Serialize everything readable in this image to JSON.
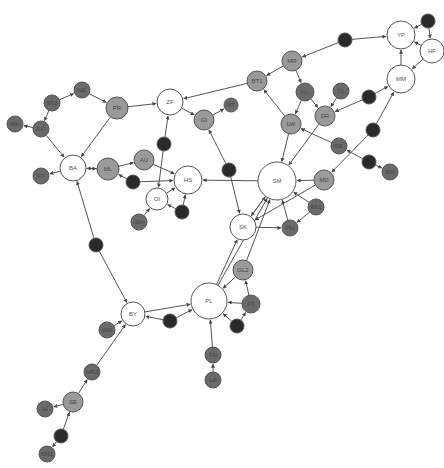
{
  "diagram": {
    "type": "directed-network",
    "colors": {
      "white": "#ffffff",
      "light": "#9a9a9a",
      "mid": "#6a6a6a",
      "dark": "#2a2a2a",
      "stroke": "#555555",
      "edge": "#555555"
    },
    "nodes": [
      {
        "id": "YP",
        "label": "YP",
        "x": 401,
        "y": 35,
        "r": 14,
        "fill": "white"
      },
      {
        "id": "HF",
        "label": "HF",
        "x": 432,
        "y": 51,
        "r": 12,
        "fill": "white"
      },
      {
        "id": "YP_top",
        "label": "",
        "x": 428,
        "y": 21,
        "r": 7,
        "fill": "dark"
      },
      {
        "id": "MM",
        "label": "MM",
        "x": 401,
        "y": 79,
        "r": 14,
        "fill": "white"
      },
      {
        "id": "MR_in",
        "label": "",
        "x": 345,
        "y": 40,
        "r": 7,
        "fill": "dark"
      },
      {
        "id": "MR",
        "label": "MR",
        "x": 292,
        "y": 61,
        "r": 10,
        "fill": "light"
      },
      {
        "id": "BT1",
        "label": "BT1",
        "x": 257,
        "y": 81,
        "r": 10,
        "fill": "light"
      },
      {
        "id": "NL",
        "label": "NL",
        "x": 305,
        "y": 92,
        "r": 9,
        "fill": "mid"
      },
      {
        "id": "CL",
        "label": "CL",
        "x": 341,
        "y": 91,
        "r": 8,
        "fill": "mid"
      },
      {
        "id": "DR_in",
        "label": "",
        "x": 369,
        "y": 97,
        "r": 7,
        "fill": "dark"
      },
      {
        "id": "DR",
        "label": "DR",
        "x": 325,
        "y": 116,
        "r": 10,
        "fill": "light"
      },
      {
        "id": "LW",
        "label": "LW",
        "x": 291,
        "y": 124,
        "r": 10,
        "fill": "light"
      },
      {
        "id": "MM_dn",
        "label": "",
        "x": 373,
        "y": 130,
        "r": 7,
        "fill": "dark"
      },
      {
        "id": "DE",
        "label": "DE",
        "x": 339,
        "y": 146,
        "r": 8,
        "fill": "mid"
      },
      {
        "id": "BE",
        "label": "",
        "x": 369,
        "y": 162,
        "r": 7,
        "fill": "dark"
      },
      {
        "id": "EM",
        "label": "EM",
        "x": 390,
        "y": 172,
        "r": 8,
        "fill": "mid"
      },
      {
        "id": "MD",
        "label": "MD",
        "x": 324,
        "y": 180,
        "r": 10,
        "fill": "light"
      },
      {
        "id": "SM",
        "label": "SM",
        "x": 277,
        "y": 181,
        "r": 19,
        "fill": "white"
      },
      {
        "id": "BT1b",
        "label": "BT1",
        "x": 316,
        "y": 207,
        "r": 8,
        "fill": "mid"
      },
      {
        "id": "PH",
        "label": "PH",
        "x": 290,
        "y": 228,
        "r": 8,
        "fill": "mid"
      },
      {
        "id": "SK",
        "label": "SK",
        "x": 243,
        "y": 227,
        "r": 13,
        "fill": "white"
      },
      {
        "id": "ZF",
        "label": "ZF",
        "x": 170,
        "y": 102,
        "r": 13,
        "fill": "white"
      },
      {
        "id": "HT",
        "label": "HT",
        "x": 231,
        "y": 105,
        "r": 7,
        "fill": "mid"
      },
      {
        "id": "GI",
        "label": "GI",
        "x": 204,
        "y": 120,
        "r": 10,
        "fill": "light"
      },
      {
        "id": "ZF_dn",
        "label": "",
        "x": 164,
        "y": 144,
        "r": 7,
        "fill": "dark"
      },
      {
        "id": "GI_dn",
        "label": "",
        "x": 229,
        "y": 170,
        "r": 7,
        "fill": "dark"
      },
      {
        "id": "PR",
        "label": "PR",
        "x": 117,
        "y": 108,
        "r": 11,
        "fill": "light"
      },
      {
        "id": "NE",
        "label": "NE",
        "x": 82,
        "y": 90,
        "r": 8,
        "fill": "mid"
      },
      {
        "id": "ST2",
        "label": "ST2",
        "x": 52,
        "y": 103,
        "r": 8,
        "fill": "mid"
      },
      {
        "id": "MH",
        "label": "MH",
        "x": 15,
        "y": 124,
        "r": 8,
        "fill": "mid"
      },
      {
        "id": "SG",
        "label": "SG",
        "x": 41,
        "y": 129,
        "r": 8,
        "fill": "mid"
      },
      {
        "id": "BA",
        "label": "BA",
        "x": 73,
        "y": 168,
        "r": 13,
        "fill": "white"
      },
      {
        "id": "FT",
        "label": "FT",
        "x": 41,
        "y": 176,
        "r": 8,
        "fill": "mid"
      },
      {
        "id": "ML",
        "label": "ML",
        "x": 108,
        "y": 169,
        "r": 11,
        "fill": "light"
      },
      {
        "id": "AU",
        "label": "AU",
        "x": 144,
        "y": 160,
        "r": 10,
        "fill": "light"
      },
      {
        "id": "ML_dn",
        "label": "",
        "x": 133,
        "y": 182,
        "r": 7,
        "fill": "dark"
      },
      {
        "id": "HS",
        "label": "HS",
        "x": 188,
        "y": 180,
        "r": 14,
        "fill": "white"
      },
      {
        "id": "OI",
        "label": "OI",
        "x": 157,
        "y": 199,
        "r": 11,
        "fill": "white"
      },
      {
        "id": "OI_r",
        "label": "",
        "x": 182,
        "y": 212,
        "r": 7,
        "fill": "dark"
      },
      {
        "id": "SH",
        "label": "SH",
        "x": 139,
        "y": 222,
        "r": 8,
        "fill": "mid"
      },
      {
        "id": "BA_dn",
        "label": "",
        "x": 96,
        "y": 245,
        "r": 7,
        "fill": "dark"
      },
      {
        "id": "BY",
        "label": "BY",
        "x": 133,
        "y": 314,
        "r": 12,
        "fill": "white"
      },
      {
        "id": "PL",
        "label": "PL",
        "x": 209,
        "y": 301,
        "r": 18,
        "fill": "white"
      },
      {
        "id": "PL_in",
        "label": "",
        "x": 170,
        "y": 321,
        "r": 7,
        "fill": "dark"
      },
      {
        "id": "GL2",
        "label": "GL2",
        "x": 243,
        "y": 270,
        "r": 10,
        "fill": "light"
      },
      {
        "id": "FS",
        "label": "FS",
        "x": 251,
        "y": 304,
        "r": 9,
        "fill": "mid"
      },
      {
        "id": "PL_dn",
        "label": "",
        "x": 237,
        "y": 326,
        "r": 7,
        "fill": "dark"
      },
      {
        "id": "FN",
        "label": "FN",
        "x": 213,
        "y": 355,
        "r": 8,
        "fill": "mid"
      },
      {
        "id": "LR",
        "label": "LR",
        "x": 213,
        "y": 380,
        "r": 8,
        "fill": "mid"
      },
      {
        "id": "WR",
        "label": "WR",
        "x": 107,
        "y": 330,
        "r": 8,
        "fill": "mid"
      },
      {
        "id": "HR2",
        "label": "HR2",
        "x": 92,
        "y": 372,
        "r": 8,
        "fill": "mid"
      },
      {
        "id": "SE",
        "label": "SE",
        "x": 73,
        "y": 402,
        "r": 10,
        "fill": "light"
      },
      {
        "id": "HI",
        "label": "HI",
        "x": 45,
        "y": 409,
        "r": 8,
        "fill": "mid"
      },
      {
        "id": "SE_dn",
        "label": "",
        "x": 61,
        "y": 436,
        "r": 7,
        "fill": "dark"
      },
      {
        "id": "NH2",
        "label": "NH2",
        "x": 47,
        "y": 454,
        "r": 8,
        "fill": "mid"
      }
    ],
    "edges": [
      [
        "MR_in",
        "YP"
      ],
      [
        "MR_in",
        "MR"
      ],
      [
        "YP_top",
        "YP"
      ],
      [
        "YP_top",
        "HF"
      ],
      [
        "HF",
        "YP"
      ],
      [
        "MM",
        "YP"
      ],
      [
        "HF",
        "MM"
      ],
      [
        "MR",
        "BT1"
      ],
      [
        "MR",
        "NL"
      ],
      [
        "NL",
        "DR"
      ],
      [
        "NL",
        "LW"
      ],
      [
        "CL",
        "DR"
      ],
      [
        "DR_in",
        "DR"
      ],
      [
        "DR_in",
        "MM"
      ],
      [
        "BT1",
        "ZF"
      ],
      [
        "LW",
        "BT1"
      ],
      [
        "LW",
        "SM"
      ],
      [
        "DR",
        "SM"
      ],
      [
        "MM_dn",
        "MM"
      ],
      [
        "MM_dn",
        "MD"
      ],
      [
        "DE",
        "LW"
      ],
      [
        "BE",
        "DE"
      ],
      [
        "BE",
        "EM"
      ],
      [
        "MD",
        "SM"
      ],
      [
        "MD",
        "SK"
      ],
      [
        "BT1b",
        "SM"
      ],
      [
        "BT1b",
        "PH"
      ],
      [
        "PH",
        "SM"
      ],
      [
        "SK",
        "PH"
      ],
      [
        "SK",
        "SM"
      ],
      [
        "SM",
        "SK"
      ],
      [
        "SM",
        "HS"
      ],
      [
        "ZF",
        "GI"
      ],
      [
        "GI",
        "HT"
      ],
      [
        "GI_dn",
        "GI"
      ],
      [
        "GI_dn",
        "SK"
      ],
      [
        "ZF_dn",
        "ZF"
      ],
      [
        "ZF_dn",
        "OI"
      ],
      [
        "PR",
        "ZF"
      ],
      [
        "PR",
        "BA"
      ],
      [
        "NE",
        "PR"
      ],
      [
        "ST2",
        "NE"
      ],
      [
        "ST2",
        "SG"
      ],
      [
        "SG",
        "MH"
      ],
      [
        "SG",
        "BA"
      ],
      [
        "BA",
        "FT"
      ],
      [
        "ML",
        "BA"
      ],
      [
        "BA",
        "ML"
      ],
      [
        "ML",
        "AU"
      ],
      [
        "ML_dn",
        "ML"
      ],
      [
        "ML_dn",
        "HS"
      ],
      [
        "AU",
        "HS"
      ],
      [
        "OI",
        "HS"
      ],
      [
        "OI_r",
        "HS"
      ],
      [
        "OI_r",
        "OI"
      ],
      [
        "SH",
        "OI"
      ],
      [
        "BA_dn",
        "BA"
      ],
      [
        "BA_dn",
        "BY"
      ],
      [
        "BY",
        "PL"
      ],
      [
        "PL_in",
        "BY"
      ],
      [
        "PL_in",
        "PL"
      ],
      [
        "PL",
        "SK"
      ],
      [
        "PL",
        "SM"
      ],
      [
        "GL2",
        "PL"
      ],
      [
        "GL2",
        "SM"
      ],
      [
        "FS",
        "GL2"
      ],
      [
        "FS",
        "PL"
      ],
      [
        "PL_dn",
        "PL"
      ],
      [
        "PL_dn",
        "FS"
      ],
      [
        "FN",
        "PL"
      ],
      [
        "LR",
        "FN"
      ],
      [
        "WR",
        "BY"
      ],
      [
        "HR2",
        "BY"
      ],
      [
        "SE",
        "HR2"
      ],
      [
        "SE",
        "HI"
      ],
      [
        "SE_dn",
        "SE"
      ],
      [
        "SE_dn",
        "NH2"
      ]
    ]
  }
}
